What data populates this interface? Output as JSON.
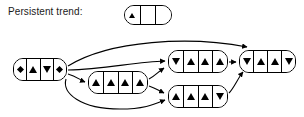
{
  "diagram": {
    "legend": {
      "label": "Persistent trend:",
      "pattern": {
        "id": "legend-pattern",
        "cells": [
          "up",
          "empty",
          "empty"
        ]
      }
    },
    "symbols": {
      "up": "up-triangle",
      "down": "down-triangle",
      "diamond": "diamond",
      "empty": "empty-cell"
    },
    "colors": {
      "stroke": "#000000",
      "fill": "#ffffff",
      "text": "#1a1a1a",
      "background": "#ffffff"
    },
    "nodes": [
      {
        "id": "node-left",
        "label": "diamond-up-down-diamond",
        "cells": [
          "diamond",
          "up",
          "down",
          "diamond"
        ],
        "x": 13,
        "y": 58,
        "width": 54,
        "height": 23
      },
      {
        "id": "node-mid-lower",
        "label": "up-up-up-up",
        "cells": [
          "up",
          "up",
          "up",
          "up"
        ],
        "x": 88,
        "y": 71,
        "width": 60,
        "height": 23
      },
      {
        "id": "node-mid-upper",
        "label": "down-up-up-up",
        "cells": [
          "down",
          "up",
          "up",
          "up"
        ],
        "x": 168,
        "y": 50,
        "width": 60,
        "height": 23
      },
      {
        "id": "node-mid-bottom",
        "label": "up-up-up-down",
        "cells": [
          "up",
          "up",
          "up",
          "down"
        ],
        "x": 168,
        "y": 85,
        "width": 60,
        "height": 23
      },
      {
        "id": "node-right",
        "label": "down-up-up-down",
        "cells": [
          "down",
          "up",
          "up",
          "down"
        ],
        "x": 239,
        "y": 50,
        "width": 57,
        "height": 23
      }
    ],
    "edges": [
      {
        "id": "edge-left-to-right-top",
        "from": "node-left",
        "to": "node-right"
      },
      {
        "id": "edge-left-to-mid-upper",
        "from": "node-left",
        "to": "node-mid-upper"
      },
      {
        "id": "edge-left-to-mid-lower",
        "from": "node-left",
        "to": "node-mid-lower"
      },
      {
        "id": "edge-left-to-mid-bottom",
        "from": "node-left",
        "to": "node-mid-bottom"
      },
      {
        "id": "edge-mid-lower-to-mid-upper",
        "from": "node-mid-lower",
        "to": "node-mid-upper"
      },
      {
        "id": "edge-mid-lower-to-mid-bottom",
        "from": "node-mid-lower",
        "to": "node-mid-bottom"
      },
      {
        "id": "edge-mid-upper-to-right",
        "from": "node-mid-upper",
        "to": "node-right"
      },
      {
        "id": "edge-mid-bottom-to-right",
        "from": "node-mid-bottom",
        "to": "node-right"
      }
    ]
  }
}
